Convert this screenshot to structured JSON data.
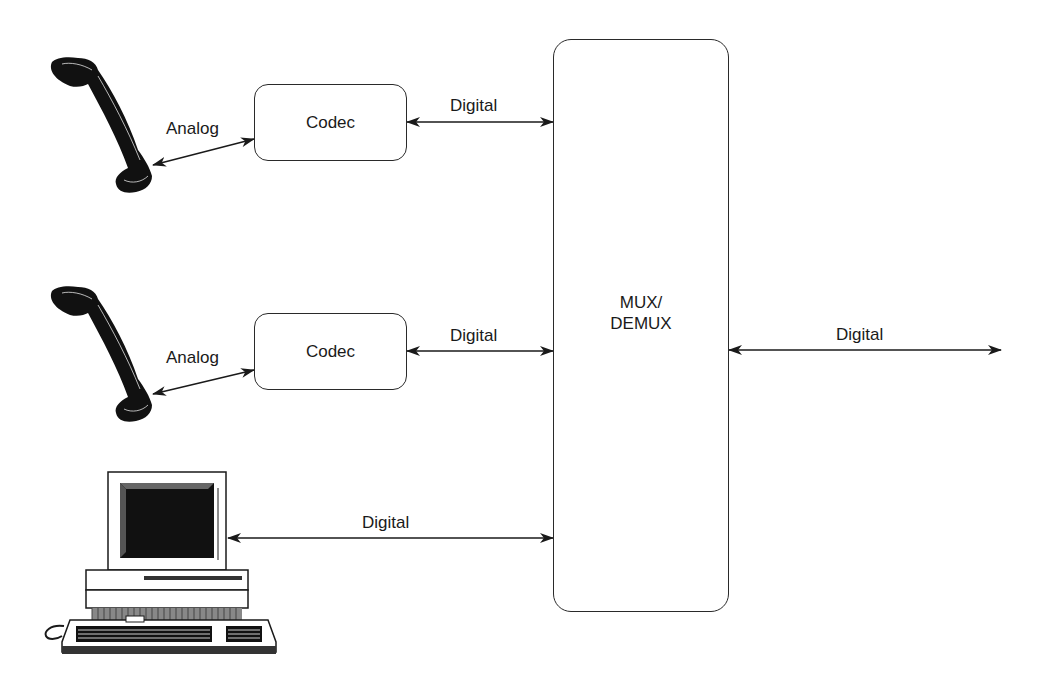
{
  "diagram": {
    "nodes": {
      "phone_1": {
        "icon": "telephone-handset-icon"
      },
      "phone_2": {
        "icon": "telephone-handset-icon"
      },
      "computer": {
        "icon": "desktop-computer-icon"
      },
      "codec_1": {
        "label": "Codec"
      },
      "codec_2": {
        "label": "Codec"
      },
      "mux": {
        "label_line1": "MUX/",
        "label_line2": "DEMUX"
      }
    },
    "edges": {
      "phone1_codec1": {
        "label": "Analog"
      },
      "codec1_mux": {
        "label": "Digital"
      },
      "phone2_codec2": {
        "label": "Analog"
      },
      "codec2_mux": {
        "label": "Digital"
      },
      "computer_mux": {
        "label": "Digital"
      },
      "mux_out": {
        "label": "Digital"
      }
    },
    "colors": {
      "stroke": "#1a1a1a",
      "background": "#ffffff"
    }
  }
}
